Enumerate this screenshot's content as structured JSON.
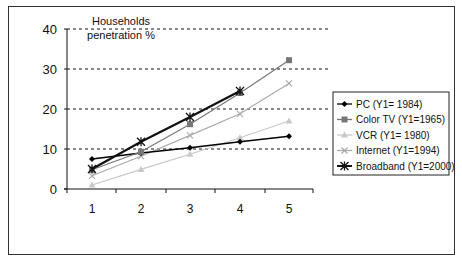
{
  "chart_data": {
    "type": "line",
    "title": "",
    "xlabel": "",
    "ylabel": "Households penetration %",
    "ylabel_lines": [
      "Households",
      "penetration %"
    ],
    "categories": [
      "1",
      "2",
      "3",
      "4",
      "5"
    ],
    "ylim": [
      0,
      40
    ],
    "yticks": [
      "0",
      "10",
      "20",
      "30",
      "40"
    ],
    "grid": "horizontal dashed",
    "legend_position": "right",
    "series": [
      {
        "name": "PC (Y1= 1984)",
        "color": "#000000",
        "marker": "diamond",
        "values": [
          7.5,
          9.0,
          10.3,
          11.8,
          13.2
        ]
      },
      {
        "name": "Color TV (Y1=1965)",
        "color": "#777777",
        "marker": "square",
        "values": [
          4.8,
          9.3,
          16.2,
          24.0,
          32.2
        ]
      },
      {
        "name": "VCR (Y1= 1980)",
        "color": "#c8c8c8",
        "marker": "triangle",
        "values": [
          1.0,
          4.9,
          8.7,
          12.8,
          17.0
        ]
      },
      {
        "name": "Internet (Y1=1994)",
        "color": "#aaaaaa",
        "marker": "x",
        "values": [
          3.3,
          8.2,
          13.4,
          18.8,
          26.4
        ]
      },
      {
        "name": "Broadband (Y1=2000)",
        "color": "#111111",
        "marker": "star",
        "values": [
          5.0,
          11.8,
          18.0,
          24.5,
          null
        ]
      }
    ]
  }
}
